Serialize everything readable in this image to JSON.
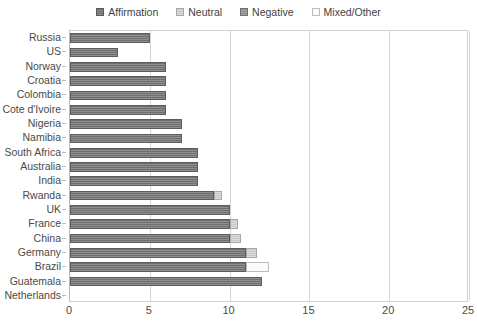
{
  "chart_data": {
    "type": "bar",
    "orientation": "horizontal",
    "stacked": true,
    "title": "",
    "xlabel": "",
    "ylabel": "",
    "xlim": [
      0,
      25
    ],
    "xticks": [
      0,
      5,
      10,
      15,
      20,
      25
    ],
    "grid": true,
    "legend_position": "top-center",
    "legend": [
      "Affirmation",
      "Neutral",
      "Negative",
      "Mixed/Other"
    ],
    "series_colors": {
      "Affirmation": "#6f6f6f",
      "Neutral": "#c9c9c9",
      "Negative": "#8a8a8a",
      "Mixed/Other": "#fbfbfb"
    },
    "categories": [
      "Russia",
      "US",
      "Norway",
      "Croatia",
      "Colombia",
      "Cote d'Ivoire",
      "Nigeria",
      "Namibia",
      "South Africa",
      "Australia",
      "India",
      "Rwanda",
      "UK",
      "France",
      "China",
      "Germany",
      "Brazil",
      "Guatemala",
      "Netherlands"
    ],
    "series": [
      {
        "name": "Affirmation",
        "values": [
          5,
          3,
          6,
          6,
          6,
          6,
          7,
          7,
          8,
          8,
          8,
          9,
          10,
          10,
          10,
          11,
          11,
          12,
          0
        ]
      },
      {
        "name": "Neutral",
        "values": [
          0,
          0,
          0,
          0,
          0,
          0,
          0,
          0,
          0,
          0,
          0,
          0.5,
          0,
          0.5,
          0.7,
          0.7,
          0,
          0,
          0
        ]
      },
      {
        "name": "Negative",
        "values": [
          0,
          0,
          0,
          0,
          0,
          0,
          0,
          0,
          0,
          0,
          0,
          0,
          0,
          0,
          0,
          0,
          0,
          0,
          0
        ]
      },
      {
        "name": "Mixed/Other",
        "values": [
          0,
          0,
          0,
          0,
          0,
          0,
          0,
          0,
          0,
          0,
          0,
          0,
          0,
          0,
          0,
          0,
          1.5,
          0,
          0
        ]
      }
    ],
    "totals": [
      5,
      3,
      6,
      6,
      6,
      6,
      7,
      7,
      8,
      8,
      8,
      9.5,
      10,
      10.5,
      10.7,
      11.7,
      12.5,
      12,
      0
    ]
  }
}
